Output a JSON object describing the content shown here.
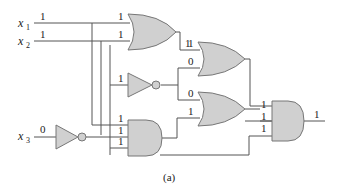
{
  "diagram": {
    "type": "logic-circuit",
    "caption": "(a)",
    "inputs": [
      {
        "name": "x",
        "sub": "1",
        "value": "1"
      },
      {
        "name": "x",
        "sub": "2",
        "value": "1"
      },
      {
        "name": "x",
        "sub": "3",
        "value": "0"
      }
    ],
    "gates": {
      "or1": {
        "type": "OR",
        "inputs": [
          "1",
          "1"
        ],
        "output": "1"
      },
      "not1": {
        "type": "NOT",
        "input": "1",
        "output": "0"
      },
      "not2": {
        "type": "NOT",
        "input": "0",
        "output": "1"
      },
      "and1": {
        "type": "AND",
        "inputs": [
          "1",
          "1",
          "1"
        ],
        "output": "1"
      },
      "or2": {
        "type": "OR",
        "inputs": [
          "1",
          "0"
        ],
        "output": "1"
      },
      "or3": {
        "type": "OR",
        "inputs": [
          "0",
          "1"
        ],
        "output": "1"
      },
      "and2": {
        "type": "AND",
        "inputs": [
          "1",
          "1",
          "1"
        ],
        "output": "1"
      }
    },
    "output_value": "1",
    "colors": {
      "gate_fill": "#d0d0d0",
      "gate_stroke": "#777777",
      "wire": "#555555"
    }
  }
}
